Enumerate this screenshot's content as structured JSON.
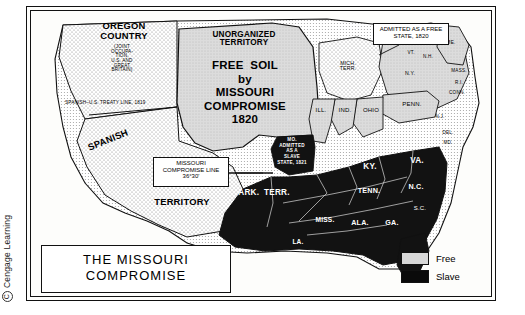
{
  "copyright": {
    "symbol": "C",
    "text": "Cengage Learning"
  },
  "title": {
    "line1": "THE  MISSOURI",
    "line2": "COMPROMISE"
  },
  "callouts": {
    "admitted_free": "ADMITTED AS A\nFREE STATE, 1820",
    "compromise_line": "MISSOURI\nCOMPROMISE\nLINE 36°30'",
    "treaty_line": "SPANISH–U.S. TREATY LINE, 1819"
  },
  "regions": [
    {
      "name": "OREGON\nCOUNTRY"
    },
    {
      "name": "(JOINT\nOCCUPA-\nTION,\nU.S. AND\nGREAT\nBRITAIN)"
    },
    {
      "name": "UNORGANIZED\nTERRITORY"
    },
    {
      "name": "FREE  SOIL\nby\nMISSOURI\nCOMPROMISE\n1820"
    },
    {
      "name": "SPANISH"
    },
    {
      "name": "TERRITORY"
    }
  ],
  "states": [
    {
      "label": "MICH.\nTERR."
    },
    {
      "label": "ME."
    },
    {
      "label": "N.H."
    },
    {
      "label": "VT."
    },
    {
      "label": "MASS."
    },
    {
      "label": "R.I."
    },
    {
      "label": "CONN."
    },
    {
      "label": "N.Y."
    },
    {
      "label": "PENN."
    },
    {
      "label": "N.J."
    },
    {
      "label": "OHIO"
    },
    {
      "label": "IND."
    },
    {
      "label": "ILL."
    },
    {
      "label": "DEL."
    },
    {
      "label": "MD."
    },
    {
      "label": "VA."
    },
    {
      "label": "KY."
    },
    {
      "label": "TENN."
    },
    {
      "label": "N.C."
    },
    {
      "label": "S.C."
    },
    {
      "label": "GA."
    },
    {
      "label": "ALA."
    },
    {
      "label": "MISS."
    },
    {
      "label": "LA."
    },
    {
      "label": "ARK.  TERR."
    },
    {
      "label": "FLA.\nTERR."
    },
    {
      "label": "MO.\nADMITTED\nAS A\nSLAVE\nSTATE, 1821"
    }
  ],
  "legend": {
    "items": [
      {
        "label": "Free",
        "color": "#d8d8d8"
      },
      {
        "label": "Slave",
        "color": "#0a0a0a"
      }
    ]
  }
}
